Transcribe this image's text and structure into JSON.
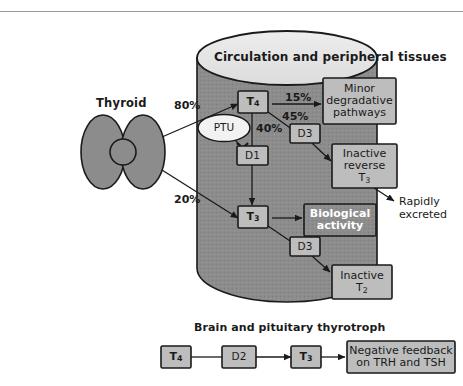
{
  "figure": {
    "title_top_rule": true,
    "colors": {
      "cylinder_body": "#8c8c8c",
      "cylinder_top": "#e3e3e3",
      "box_fill": "#bdbdbd",
      "box_fill_light": "#d2d2d2",
      "thyroid_fill": "#8c8c8c",
      "ptu_fill": "#f2f2f2",
      "stroke": "#1a1a1a",
      "text": "#1a1a1a",
      "text_inverse": "#ffffff"
    }
  },
  "thyroid": {
    "label": "Thyroid",
    "flows": [
      {
        "label": "80%",
        "target": "T4"
      },
      {
        "label": "20%",
        "target": "T3"
      }
    ]
  },
  "cylinder": {
    "title": "Circulation and peripheral tissues"
  },
  "nodes": {
    "t4": {
      "label": "T",
      "sub": "4"
    },
    "t3": {
      "label": "T",
      "sub": "3"
    },
    "d1": {
      "label": "D1"
    },
    "d3_upper": {
      "label": "D3"
    },
    "d3_lower": {
      "label": "D3"
    },
    "ptu": {
      "label": "PTU"
    },
    "minor_degradative": {
      "line1": "Minor",
      "line2": "degradative",
      "line3": "pathways"
    },
    "inactive_reverse_t3": {
      "line1": "Inactive",
      "line2": "reverse",
      "line3": "T",
      "line3_sub": "3"
    },
    "biological_activity": {
      "line1": "Biological",
      "line2": "activity"
    },
    "inactive_t2": {
      "line1": "Inactive",
      "line2": "T",
      "line2_sub": "2"
    },
    "rapidly_excreted": {
      "line1": "Rapidly",
      "line2": "excreted"
    }
  },
  "percentages": {
    "to_minor_degradative": "15%",
    "to_d3": "45%",
    "to_d1": "40%"
  },
  "brain": {
    "section_title": "Brain and pituitary thyrotroph",
    "t4": {
      "label": "T",
      "sub": "4"
    },
    "d2": {
      "label": "D2"
    },
    "t3": {
      "label": "T",
      "sub": "3"
    },
    "feedback": {
      "line1": "Negative feedback",
      "line2": "on TRH and TSH"
    }
  }
}
